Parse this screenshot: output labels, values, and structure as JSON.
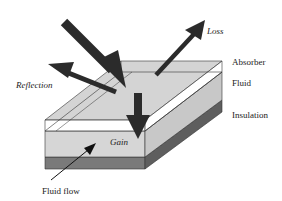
{
  "diagram": {
    "title": "",
    "labels": {
      "loss": "Loss",
      "reflection": "Reflection",
      "absorber": "Absorber",
      "fluid": "Fluid",
      "insulation": "Insulation",
      "gain": "Gain",
      "fluid_flow": "Fluid flow"
    },
    "layers": [
      "Absorber",
      "Fluid",
      "Insulation"
    ],
    "arrows": [
      "Incoming radiation",
      "Reflection",
      "Loss",
      "Gain",
      "Fluid flow"
    ],
    "colors": {
      "absorber_top": "#d4d4d4",
      "absorber_face": "#ffffff",
      "fluid_face": "#d6d6d6",
      "fluid_side": "#c8c8c8",
      "insulation_face": "#7a7a7a",
      "insulation_side": "#5e5e5e",
      "arrow": "#2b2b2b"
    }
  }
}
